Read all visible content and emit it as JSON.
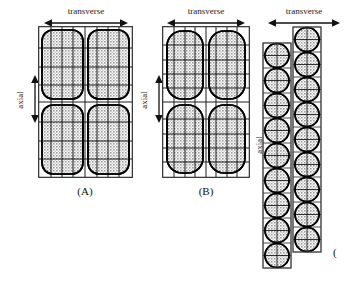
{
  "figure": {
    "background_color": "#ffffff",
    "ink_color": "#111111",
    "fill_gray": "#b9b9b9",
    "mesh_color": "#222222",
    "outline_color": "#000000",
    "panels": [
      {
        "id": "A",
        "caption": "(A)",
        "transverse_label": "transverse",
        "axial_label": "axial",
        "shape_type": "stadium",
        "columns": 2,
        "rows": 2,
        "mesh_vertical_lines": 5,
        "mesh_horizontal_lines": 7,
        "description": "two-by-two array of wide rounded-rectangle (stadium) elements inside an outer rectangular boundary with overlaid finite-element mesh"
      },
      {
        "id": "B",
        "caption": "(B)",
        "transverse_label": "transverse",
        "axial_label": "axial",
        "shape_type": "stadium",
        "columns": 2,
        "rows": 2,
        "mesh_vertical_lines": 5,
        "mesh_horizontal_lines": 9,
        "description": "two-by-two array of narrower, more strongly rounded stadium elements with a finer axial mesh"
      },
      {
        "id": "C",
        "caption": "(",
        "transverse_label": "transverse",
        "axial_label": "axial",
        "shape_type": "circle",
        "columns": 2,
        "left_column_circles": 9,
        "right_column_circles": 9,
        "column_offset": "right column shifted upward by half a cell",
        "description": "two staggered columns of circular elements inside rectangular cells, right column offset upward"
      }
    ]
  }
}
